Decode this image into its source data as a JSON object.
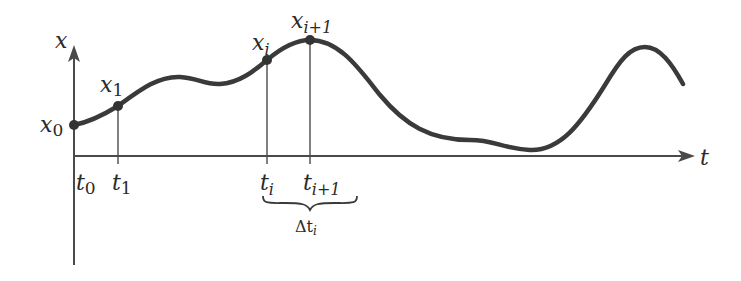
{
  "diagram": {
    "type": "function-plot-discretization",
    "colors": {
      "curve": "#3a3a3a",
      "axis": "#4a4a4a",
      "text": "#2a2a2a",
      "background": "#ffffff"
    },
    "axes": {
      "vertical": {
        "label": "x"
      },
      "horizontal": {
        "label": "t"
      }
    },
    "points": [
      {
        "name": "x0",
        "label": "x",
        "sub": "0"
      },
      {
        "name": "x1",
        "label": "x",
        "sub": "1"
      },
      {
        "name": "xi",
        "label": "x",
        "sub": "i"
      },
      {
        "name": "xi1",
        "label": "x",
        "sub": "i+1"
      }
    ],
    "ticks": [
      {
        "name": "t0",
        "label": "t",
        "sub": "0"
      },
      {
        "name": "t1",
        "label": "t",
        "sub": "1"
      },
      {
        "name": "ti",
        "label": "t",
        "sub": "i"
      },
      {
        "name": "ti1",
        "label": "t",
        "sub": "i+1"
      }
    ],
    "brace": {
      "label": "Δt",
      "sub": "i"
    }
  }
}
